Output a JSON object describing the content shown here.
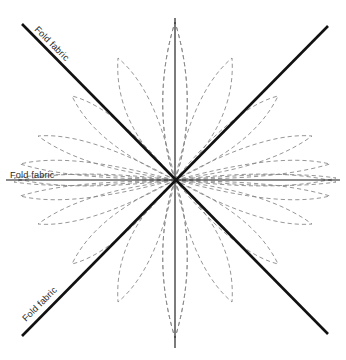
{
  "diagram": {
    "canvas": {
      "width": 346,
      "height": 360,
      "background": "#ffffff"
    },
    "center": {
      "x": 175,
      "y": 180
    },
    "labels": {
      "horizontal_fold": "Fold fabric",
      "diagonal_top_left_fold": "Fold fabric",
      "diagonal_bottom_left_fold": "Fold fabric"
    },
    "colors": {
      "petal_stroke": "#8a8a8a",
      "axis_stroke": "#1a1a1a",
      "diagonal_stroke": "#111111",
      "label_text": "#2b2b2b",
      "background": "#ffffff"
    },
    "axes": [
      {
        "name": "horizontal-fold-axis",
        "x1": 6,
        "y1": 180,
        "x2": 340,
        "y2": 180
      },
      {
        "name": "vertical-fold-axis",
        "x1": 175,
        "y1": 18,
        "x2": 175,
        "y2": 348
      },
      {
        "name": "diagonal-fold-axis-nwse",
        "x1": 22,
        "y1": 24,
        "x2": 328,
        "y2": 334
      },
      {
        "name": "diagonal-fold-axis-swne",
        "x1": 22,
        "y1": 336,
        "x2": 328,
        "y2": 26
      }
    ],
    "petals": {
      "count_total": 24,
      "count_per_quadrant": 6,
      "angles_degrees": [
        15,
        37,
        56,
        73,
        90,
        105,
        120,
        143,
        162,
        180,
        197,
        215,
        233,
        250,
        270,
        287,
        305,
        322,
        340,
        358,
        15,
        35,
        55,
        75
      ],
      "note": "Teardrop petals radiate from the center; tips are rounded and reach the square outline."
    }
  }
}
